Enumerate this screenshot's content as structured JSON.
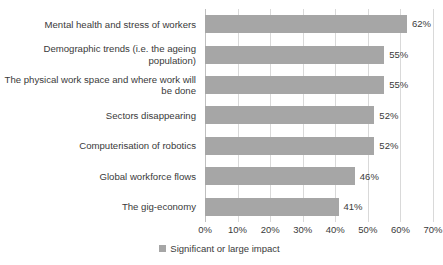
{
  "chart_data": {
    "type": "bar",
    "orientation": "horizontal",
    "title": "",
    "xlabel": "",
    "ylabel": "",
    "xlim": [
      0,
      70
    ],
    "grid": true,
    "legend_position": "bottom",
    "legend": [
      "Significant or large impact"
    ],
    "xticks": [
      "0%",
      "10%",
      "20%",
      "30%",
      "40%",
      "50%",
      "60%",
      "70%"
    ],
    "xtick_values": [
      0,
      10,
      20,
      30,
      40,
      50,
      60,
      70
    ],
    "categories": [
      "Mental health and stress of workers",
      "Demographic trends (i.e. the ageing population)",
      "The physical work space and where work will be done",
      "Sectors disappearing",
      "Computerisation of robotics",
      "Global workforce flows",
      "The gig-economy"
    ],
    "series": [
      {
        "name": "Significant or large impact",
        "color": "#a6a6a6",
        "values": [
          62,
          55,
          55,
          52,
          52,
          46,
          41
        ],
        "labels": [
          "62%",
          "55%",
          "55%",
          "52%",
          "52%",
          "46%",
          "41%"
        ]
      }
    ]
  },
  "colors": {
    "bar": "#a6a6a6",
    "gridline": "#d9d9d9",
    "text": "#3a3a3a",
    "background": "#ffffff"
  }
}
